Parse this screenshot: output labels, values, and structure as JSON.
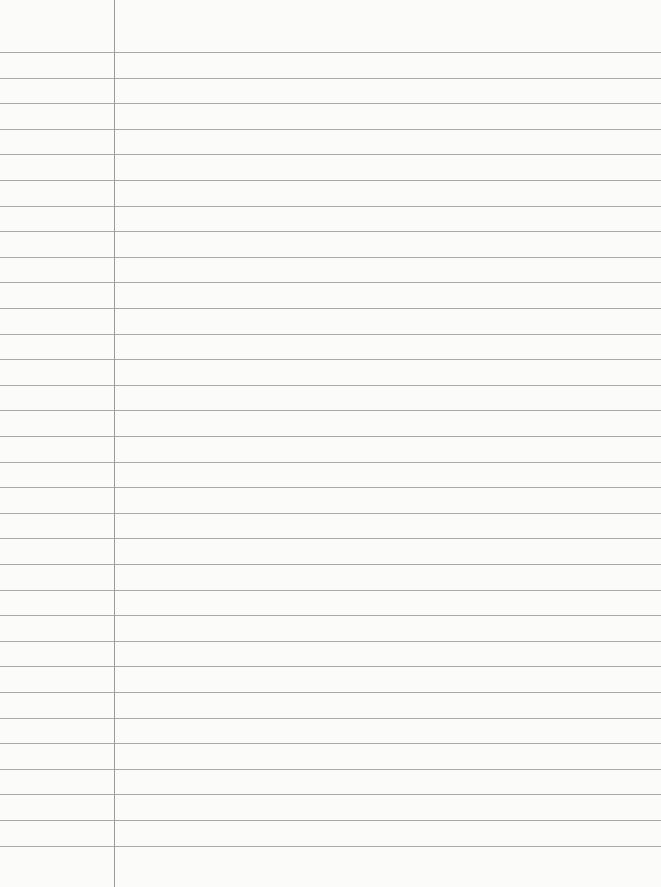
{
  "paper": {
    "type": "lined notebook paper",
    "background_color": "#fbfbfa",
    "rule_color": "#a9a9a9",
    "margin_color": "#9c9c9c",
    "first_rule_y": 52,
    "rule_spacing": 25.6,
    "rule_count": 32,
    "margin_x": 114
  }
}
